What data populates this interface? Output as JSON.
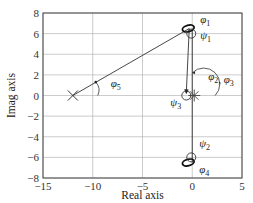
{
  "chart_data": {
    "type": "scatter",
    "title": "",
    "xlabel": "Real axis",
    "ylabel": "Imag axis",
    "xlim": [
      -15,
      5
    ],
    "ylim": [
      -8,
      8
    ],
    "xticks": [
      -15,
      -10,
      -5,
      0,
      5
    ],
    "yticks": [
      8,
      6,
      4,
      2,
      0,
      -2,
      -4,
      -6,
      -8
    ],
    "xtick_labels": [
      "−15",
      "−10",
      "−5",
      "0",
      "5"
    ],
    "ytick_labels": [
      "8",
      "6",
      "4",
      "2",
      "0",
      "−2",
      "−4",
      "−6",
      "−8"
    ],
    "grid": true,
    "legend": null,
    "poles": [
      {
        "x": -12,
        "y": 0,
        "marker": "x"
      },
      {
        "x": 0.2,
        "y": 0,
        "marker": "asterisk"
      },
      {
        "x": -0.3,
        "y": 6.5,
        "marker": "ellipse"
      },
      {
        "x": -0.3,
        "y": -6.5,
        "marker": "ellipse"
      }
    ],
    "zeros": [
      {
        "x": -0.6,
        "y": 0,
        "marker": "o"
      },
      {
        "x": -0.1,
        "y": 6.0,
        "marker": "o"
      },
      {
        "x": -0.1,
        "y": -6.0,
        "marker": "o"
      }
    ],
    "lines": [
      {
        "from": [
          -12,
          0
        ],
        "to": [
          -0.3,
          6.5
        ],
        "label": "phi5 ray"
      },
      {
        "from": [
          -0.3,
          6.5
        ],
        "to": [
          -0.6,
          0.2
        ],
        "label": "psi3 ray",
        "arrow": true
      },
      {
        "from": [
          0,
          6.5
        ],
        "to": [
          0,
          -6.5
        ],
        "label": "phi2/phi3 ray"
      }
    ],
    "annotations": [
      {
        "text": "φ1",
        "x": 0.8,
        "y": 7.0
      },
      {
        "text": "ψ1",
        "x": 0.8,
        "y": 5.5
      },
      {
        "text": "φ2, φ3",
        "x": 1.6,
        "y": 1.5
      },
      {
        "text": "ψ3",
        "x": -2.2,
        "y": -1.0
      },
      {
        "text": "ψ2",
        "x": 0.7,
        "y": -5.0
      },
      {
        "text": "φ4",
        "x": 0.7,
        "y": -7.5
      },
      {
        "text": "φ5",
        "x": -8.2,
        "y": 0.8
      }
    ]
  }
}
